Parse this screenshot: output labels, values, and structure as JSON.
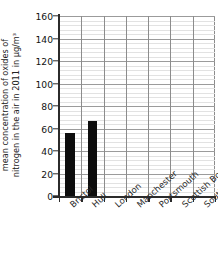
{
  "chart_data": {
    "type": "bar",
    "title": "",
    "subtitle": "",
    "xlabel": "",
    "ylabel": "mean concentration of oxides of nitrogen in the air in 2011 in µg/m³",
    "ylabel_lines": [
      "mean concentration of oxides of",
      "nitrogen in the air in 2011 in µg/m³"
    ],
    "categories": [
      "Bristol",
      "Hull",
      "London",
      "Manchester",
      "Portsmouth",
      "Scottish Borders",
      "South Wales"
    ],
    "values": [
      56,
      67,
      null,
      null,
      null,
      null,
      null
    ],
    "ylim": [
      0,
      160
    ],
    "ytick_labels": [
      "0",
      "20",
      "40",
      "60",
      "80",
      "100",
      "120",
      "140",
      "160"
    ],
    "ytick_values": [
      0,
      20,
      40,
      60,
      80,
      100,
      120,
      140,
      160
    ],
    "minor_tick_step": 4,
    "grid": true,
    "legend": "none",
    "bar_color": "#0d0d0d",
    "grid_major_color": "#9b9b9b",
    "grid_minor_color": "#e2e2e2",
    "axis_color": "#2b2b2b",
    "background": "#ffffff"
  }
}
